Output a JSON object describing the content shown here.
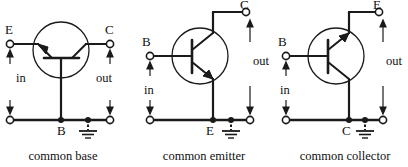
{
  "figure": {
    "stroke_color": "#1a1a1a",
    "background": "#ffffff",
    "device_type": "NPN bipolar junction transistor"
  },
  "circuits": [
    {
      "id": "common-base",
      "caption": "common base",
      "caption_x": 63,
      "terminals": {
        "top_left": "E",
        "top_right": "C"
      },
      "signals": {
        "input": "in",
        "output": "out"
      },
      "common_node_label": "B",
      "ground": true,
      "orientation": "base-down, emitter-left, collector-right"
    },
    {
      "id": "common-emitter",
      "caption": "common emitter",
      "caption_x": 204,
      "terminals": {
        "left": "B",
        "top_right": "C"
      },
      "signals": {
        "input": "in",
        "output": "out"
      },
      "common_node_label": "E",
      "ground": true,
      "orientation": "base-left, collector-up, emitter-down"
    },
    {
      "id": "common-collector",
      "caption": "common collector",
      "caption_x": 345,
      "terminals": {
        "left": "B",
        "top_right": "E"
      },
      "signals": {
        "input": "in",
        "output": "out"
      },
      "common_node_label": "C",
      "ground": true,
      "orientation": "base-left, emitter-up, collector-down"
    }
  ]
}
